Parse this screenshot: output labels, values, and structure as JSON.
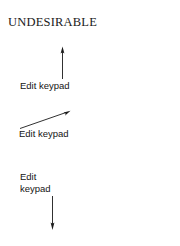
{
  "figure": {
    "title": "UNDESIRABLE",
    "background_color": "#ffffff",
    "ink_color": "#1a1a1a",
    "width": 180,
    "height": 246
  },
  "callouts": [
    {
      "label": "Edit keypad",
      "arrow_direction": "up",
      "arrow_name": "arrow-up"
    },
    {
      "label": "Edit keypad",
      "arrow_direction": "up-right",
      "arrow_name": "arrow-diagonal-up-right"
    },
    {
      "label": "Edit\nkeypad",
      "arrow_direction": "down",
      "arrow_name": "arrow-down"
    }
  ]
}
